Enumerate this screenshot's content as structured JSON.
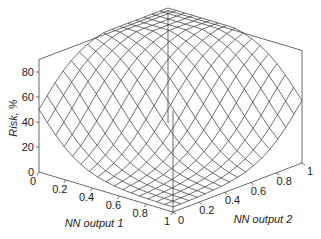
{
  "chart_data": {
    "type": "surface3d",
    "title": "",
    "xlabel": "NN output 1",
    "ylabel": "NN output 2",
    "zlabel": "Risk, %",
    "x_ticks": [
      "0",
      "0.2",
      "0.4",
      "0.6",
      "0.8",
      "1"
    ],
    "y_ticks": [
      "0",
      "0.2",
      "0.4",
      "0.6",
      "0.8",
      "1"
    ],
    "z_ticks": [
      "0",
      "20",
      "40",
      "60",
      "80"
    ],
    "xlim": [
      0,
      1
    ],
    "ylim": [
      0,
      1
    ],
    "zlim": [
      0,
      90
    ],
    "grid_resolution": 16,
    "corner_values": {
      "nn1_0_nn2_0": 50,
      "nn1_1_nn2_1": 50,
      "nn1_0_nn2_1": 92,
      "nn1_1_nn2_0": 0
    },
    "colors": {
      "line": "#333333",
      "box": "#444444",
      "background": "#ffffff"
    }
  },
  "labels": {
    "z_axis_title": "Risk, %",
    "x_axis_title": "NN output 1",
    "y_axis_title": "NN output 2"
  }
}
